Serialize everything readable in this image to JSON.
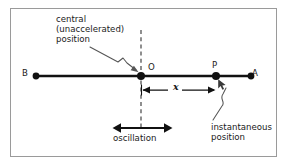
{
  "figure": {
    "background_color": "#ffffff",
    "frame": {
      "name": "outer-border",
      "color": "#9a9a9a",
      "x": 10,
      "y": 8,
      "width": 267,
      "height": 149
    },
    "axis_line": {
      "name": "motion-path-line",
      "color": "#111111",
      "y": 76,
      "x_start": 36,
      "x_end": 251,
      "thickness": 2.2
    },
    "dashed_line": {
      "name": "central-position-dashed-line",
      "color": "#333333",
      "x": 141,
      "y_top": 30,
      "y_bottom": 128,
      "dash": "4,3"
    }
  },
  "points": [
    {
      "id": "B",
      "label": "B",
      "cx": 36,
      "cy": 76,
      "r": 3.4,
      "label_side": "left"
    },
    {
      "id": "O",
      "label": "O",
      "cx": 141,
      "cy": 76,
      "r": 3.9,
      "label_side": "above-right"
    },
    {
      "id": "P",
      "label": "P",
      "cx": 216,
      "cy": 76,
      "r": 3.9,
      "label_side": "above"
    },
    {
      "id": "A",
      "label": "A",
      "cx": 251,
      "cy": 76,
      "r": 3.4,
      "label_side": "right"
    }
  ],
  "annotations": {
    "central_position": {
      "name": "central-position-label",
      "lines": [
        "central",
        "(unaccelerated)",
        "position"
      ],
      "text": "central\n(unaccelerated)\nposition",
      "target_point": "O"
    },
    "instantaneous_position": {
      "name": "instantaneous-position-label",
      "lines": [
        "instantaneous",
        "position"
      ],
      "text": "instantaneous\nposition",
      "target_point": "P"
    },
    "oscillation": {
      "name": "oscillation-label",
      "text": "oscillation",
      "arrow_x_start": 113,
      "arrow_x_end": 172,
      "arrow_y": 128,
      "double_headed": true
    },
    "displacement": {
      "name": "displacement-dimension-label",
      "symbol": "x",
      "from_point": "O",
      "to_point": "P",
      "line_y": 90,
      "x_start": 141,
      "x_end": 216,
      "double_headed": true
    }
  },
  "colors": {
    "ink": "#111111",
    "leader": "#555555",
    "frame": "#9a9a9a",
    "dash": "#333333"
  }
}
